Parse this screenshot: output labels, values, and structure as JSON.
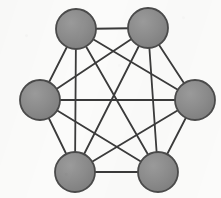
{
  "figure": {
    "kind": "graph-diagram",
    "name": "complete-graph-k6",
    "width": 221,
    "height": 198,
    "background_color": "#fbfbfa"
  },
  "style": {
    "node_fill": "#8a8a8a",
    "node_fill_highlight": "#9a9a9a",
    "node_stroke": "#4a4a4a",
    "node_stroke_width": 1.8,
    "node_radius": 20,
    "edge_color": "#3a3a3a",
    "edge_width": 1.8
  },
  "graph": {
    "type": "complete",
    "node_count": 6,
    "edge_count": 15,
    "degree_per_node": 5,
    "nodes": [
      {
        "id": "n1",
        "label": "",
        "position": "top-left",
        "cx": 76,
        "cy": 29
      },
      {
        "id": "n2",
        "label": "",
        "position": "top-right",
        "cx": 148,
        "cy": 28
      },
      {
        "id": "n3",
        "label": "",
        "position": "right",
        "cx": 195,
        "cy": 100
      },
      {
        "id": "n4",
        "label": "",
        "position": "bottom-right",
        "cx": 158,
        "cy": 172
      },
      {
        "id": "n5",
        "label": "",
        "position": "bottom-left",
        "cx": 75,
        "cy": 172
      },
      {
        "id": "n6",
        "label": "",
        "position": "left",
        "cx": 40,
        "cy": 100
      }
    ],
    "edges": [
      {
        "from": "n1",
        "to": "n2"
      },
      {
        "from": "n1",
        "to": "n3"
      },
      {
        "from": "n1",
        "to": "n4"
      },
      {
        "from": "n1",
        "to": "n5"
      },
      {
        "from": "n1",
        "to": "n6"
      },
      {
        "from": "n2",
        "to": "n3"
      },
      {
        "from": "n2",
        "to": "n4"
      },
      {
        "from": "n2",
        "to": "n5"
      },
      {
        "from": "n2",
        "to": "n6"
      },
      {
        "from": "n3",
        "to": "n4"
      },
      {
        "from": "n3",
        "to": "n5"
      },
      {
        "from": "n3",
        "to": "n6"
      },
      {
        "from": "n4",
        "to": "n5"
      },
      {
        "from": "n4",
        "to": "n6"
      },
      {
        "from": "n5",
        "to": "n6"
      }
    ]
  }
}
